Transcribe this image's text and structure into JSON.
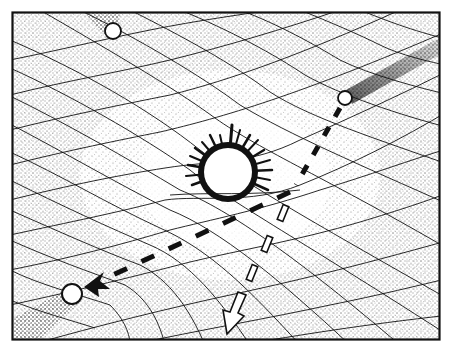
{
  "figure": {
    "type": "illustration",
    "style": "black-and-white stippled pen drawing",
    "colors": {
      "ink": "#111111",
      "paper": "#ffffff",
      "stipple": "#222222"
    }
  },
  "elements": {
    "frame": {
      "x": 12,
      "y": 12,
      "width": 428,
      "height": 328
    },
    "massive_body": {
      "cx": 228,
      "cy": 172,
      "r": 25,
      "label": ""
    },
    "balls": [
      {
        "id": "top",
        "cx": 113,
        "cy": 31,
        "r": 8
      },
      {
        "id": "right",
        "cx": 345,
        "cy": 98,
        "r": 7
      },
      {
        "id": "left",
        "cx": 72,
        "cy": 294,
        "r": 10
      }
    ],
    "deflected_path": {
      "style": "black dashed arrow",
      "points": [
        [
          345,
          104
        ],
        [
          292,
          190
        ],
        [
          90,
          285
        ]
      ]
    },
    "undeflected_path": {
      "style": "hollow dashed arrow",
      "points": [
        [
          292,
          190
        ],
        [
          230,
          335
        ]
      ]
    }
  }
}
